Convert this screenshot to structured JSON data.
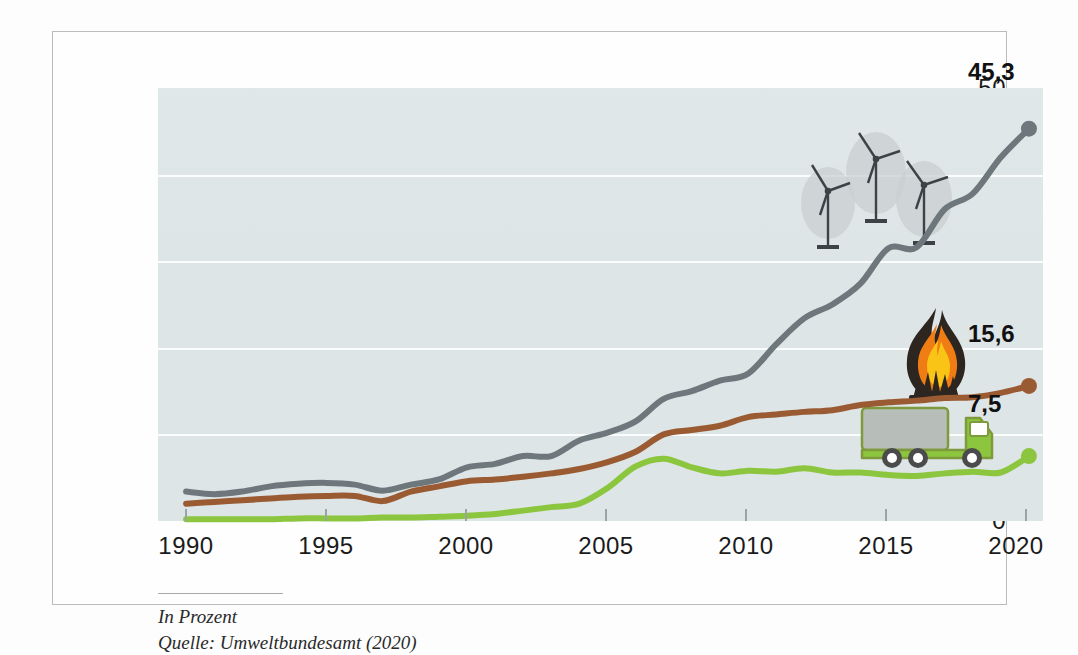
{
  "figure": {
    "footer_unit": "In Prozent",
    "footer_source": "Quelle: Umweltbundesamt (2020)"
  },
  "colors": {
    "electricity": "#6e777b",
    "heat": "#9a5b33",
    "transport": "#8cc63f",
    "plot_background": "#dde5e6",
    "gridline": "#fbfdfd",
    "frame": "#b9bcbe",
    "text": "#1b1b1b"
  },
  "icons": {
    "wind_turbines": "wind-turbine-icon",
    "flame": "flame-icon",
    "truck": "truck-icon"
  },
  "endpoint_labels": {
    "electricity": "45,3",
    "heat": "15,6",
    "transport": "7,5"
  },
  "chart_data": {
    "type": "line",
    "title": "",
    "subtitle": "",
    "xlabel": "",
    "ylabel": "",
    "unit": "In Prozent",
    "source": "Umweltbundesamt (2020)",
    "grid": true,
    "legend_position": "none",
    "xlim": [
      1989,
      2020.5
    ],
    "ylim": [
      0,
      50
    ],
    "yticks": [
      0,
      10,
      20,
      30,
      40,
      50
    ],
    "xticks": [
      1990,
      1995,
      2000,
      2005,
      2010,
      2015,
      2020
    ],
    "x": [
      1990,
      1991,
      1992,
      1993,
      1994,
      1995,
      1996,
      1997,
      1998,
      1999,
      2000,
      2001,
      2002,
      2003,
      2004,
      2005,
      2006,
      2007,
      2008,
      2009,
      2010,
      2011,
      2012,
      2013,
      2014,
      2015,
      2016,
      2017,
      2018,
      2019,
      2020
    ],
    "series": [
      {
        "name": "Strom",
        "icon": "wind-turbine-icon",
        "color": "#6e777b",
        "end_label": "45,3",
        "values": [
          3.4,
          3.1,
          3.4,
          4.0,
          4.3,
          4.4,
          4.2,
          3.5,
          4.2,
          4.8,
          6.2,
          6.6,
          7.5,
          7.5,
          9.3,
          10.2,
          11.5,
          14.1,
          15.0,
          16.2,
          17.0,
          20.4,
          23.4,
          25.0,
          27.4,
          31.5,
          31.6,
          36.0,
          37.8,
          42.0,
          45.3
        ]
      },
      {
        "name": "Wärme",
        "icon": "flame-icon",
        "color": "#9a5b33",
        "end_label": "15,6",
        "values": [
          2.0,
          2.2,
          2.4,
          2.6,
          2.8,
          2.9,
          2.9,
          2.3,
          3.4,
          4.0,
          4.6,
          4.8,
          5.1,
          5.5,
          6.0,
          6.8,
          8.0,
          10.0,
          10.5,
          11.0,
          12.0,
          12.3,
          12.6,
          12.8,
          13.4,
          13.7,
          13.9,
          14.2,
          14.3,
          14.8,
          15.6
        ]
      },
      {
        "name": "Verkehr",
        "icon": "truck-icon",
        "color": "#8cc63f",
        "end_label": "7,5",
        "values": [
          0.2,
          0.2,
          0.2,
          0.2,
          0.3,
          0.3,
          0.3,
          0.4,
          0.4,
          0.5,
          0.6,
          0.8,
          1.2,
          1.6,
          2.0,
          3.8,
          6.3,
          7.2,
          6.2,
          5.5,
          5.8,
          5.7,
          6.1,
          5.6,
          5.6,
          5.3,
          5.2,
          5.5,
          5.7,
          5.6,
          7.5
        ]
      }
    ]
  },
  "axis": {
    "y_labels": [
      "0",
      "10",
      "20",
      "30",
      "40",
      "50"
    ],
    "x_labels": [
      "1990",
      "1995",
      "2000",
      "2005",
      "2010",
      "2015",
      "2020"
    ]
  }
}
